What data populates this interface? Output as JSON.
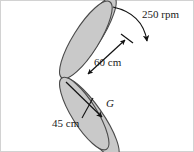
{
  "figure": {
    "labels": {
      "rotation_speed": "250 rpm",
      "blade_radius": "60 cm",
      "cg_radius": "45 cm",
      "center_of_gravity": "G"
    },
    "colors": {
      "blade_fill": "#c9c9c9",
      "blade_stroke": "#4a4a4a",
      "annotation": "#111111",
      "frame": "#cfcfcf",
      "background": "#ffffff"
    },
    "geometry": {
      "hub": [
        62,
        78
      ],
      "blade_count": 4,
      "blade_angles_deg": [
        126,
        57,
        237,
        309
      ],
      "blade_length_px": 66,
      "blade_half_width_px": 14
    },
    "annotations": {
      "rotation_arrow": "curved-arrow-clockwise",
      "dimension_60cm": "double-headed-dimension-arrow",
      "leader_45cm": "leader-line-to-cg-arrow"
    }
  }
}
